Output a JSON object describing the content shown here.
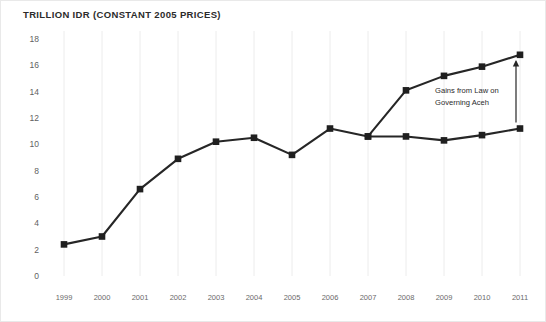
{
  "chart_data": {
    "type": "line",
    "title": "TRILLION IDR (CONSTANT 2005 PRICES)",
    "xlabel": "",
    "ylabel": "",
    "ylim": [
      0,
      18
    ],
    "yticks": [
      0,
      2,
      4,
      6,
      8,
      10,
      12,
      14,
      16,
      18
    ],
    "ytick_labels": [
      "0",
      "2",
      "4",
      "6",
      "8",
      "10",
      "12",
      "14",
      "16",
      "18"
    ],
    "grid": "vertical",
    "legend": "none",
    "categories": [
      "1999",
      "2000",
      "2001",
      "2002",
      "2003",
      "2004",
      "2005",
      "2006",
      "2007",
      "2008",
      "2009",
      "2010",
      "2011"
    ],
    "series": [
      {
        "name": "Aceh revenue with Law on Governing Aceh",
        "x": [
          "1999",
          "2000",
          "2001",
          "2002",
          "2003",
          "2004",
          "2005",
          "2006",
          "2007",
          "2008",
          "2009",
          "2010",
          "2011"
        ],
        "values": [
          2.4,
          3.0,
          6.6,
          8.9,
          10.2,
          10.5,
          9.2,
          11.2,
          10.6,
          14.1,
          15.2,
          15.9,
          16.8
        ],
        "color": "#262626",
        "marker": "square"
      },
      {
        "name": "Aceh revenue without Law on Governing Aceh",
        "x": [
          "2007",
          "2008",
          "2009",
          "2010",
          "2011"
        ],
        "values": [
          10.6,
          10.6,
          10.3,
          10.7,
          11.2
        ],
        "color": "#262626",
        "marker": "square"
      }
    ],
    "annotations": [
      {
        "name": "gains-annotation",
        "lines": [
          "Gains from Law on",
          "Governing Aceh"
        ],
        "arrow": "up",
        "arrow_x": "2011",
        "arrow_from": 11.2,
        "arrow_to": 16.3
      }
    ],
    "colors": {
      "line": "#262626",
      "marker": "#1f1f1f",
      "gridline": "#ececec",
      "axis_text": "#5f5f5f",
      "title_text": "#2b2b2b",
      "background": "#ffffff",
      "border": "#e9e9e9"
    }
  }
}
